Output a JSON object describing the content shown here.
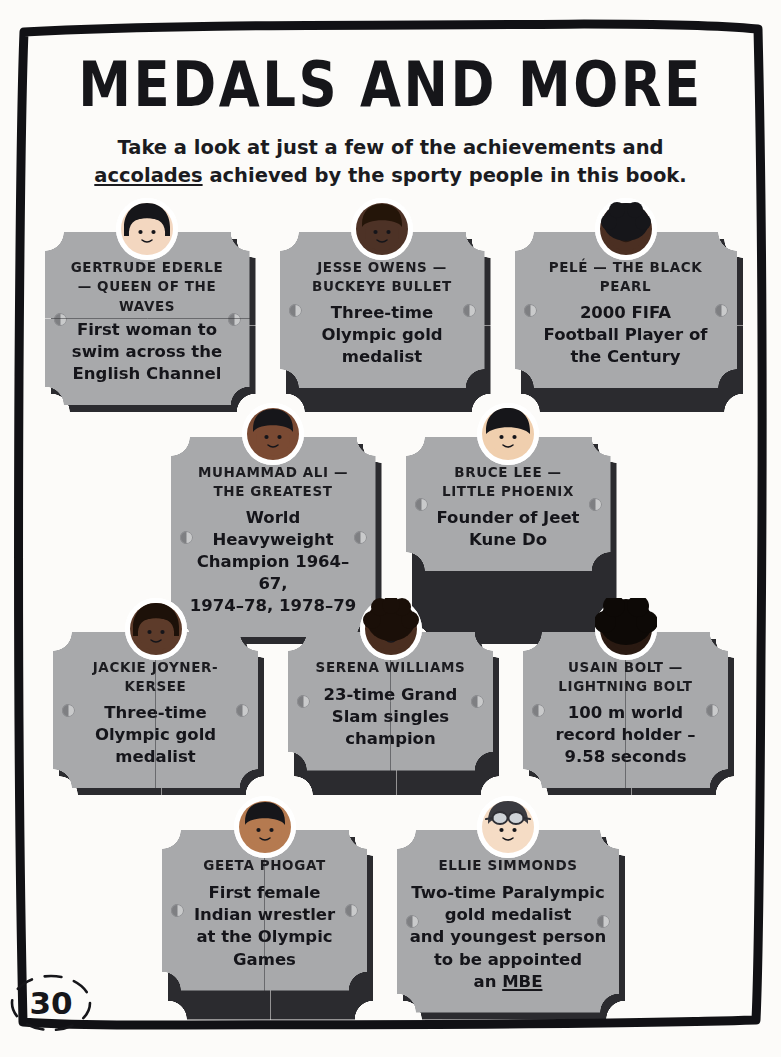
{
  "page": {
    "title_line": "MEDALS AND MORE",
    "page_number": "30"
  },
  "intro": {
    "line1": "Take a look at just a few of the achievements and",
    "line2_pre": "",
    "line2_underlined": "accolades",
    "line2_post": " achieved by the sporty people in this book."
  },
  "rows": [
    {
      "cards": [
        {
          "name": "GERTRUDE EDERLE — QUEEN OF THE WAVES",
          "name_lines": [
            "GERTRUDE EDERLE",
            "— QUEEN OF THE",
            "WAVES"
          ],
          "desc_lines": [
            "First woman to",
            "swim across the",
            "English Channel"
          ],
          "avatar": "avatar-gertrude-ederle",
          "skin": "#f3d7c0",
          "hair": "#16161a",
          "hair_style": "bob"
        },
        {
          "name": "JESSE OWENS — BUCKEYE BULLET",
          "name_lines": [
            "JESSE OWENS —",
            "BUCKEYE BULLET"
          ],
          "desc_lines": [
            "Three-time",
            "Olympic gold",
            "medalist"
          ],
          "avatar": "avatar-jesse-owens",
          "skin": "#4d3226",
          "hair": "#241509",
          "hair_style": "short"
        },
        {
          "name": "PELÉ — THE BLACK PEARL",
          "name_lines": [
            "PELÉ — THE BLACK",
            "PEARL"
          ],
          "desc_lines": [
            "2000 FIFA",
            "Football Player of",
            "the Century"
          ],
          "avatar": "avatar-pele",
          "skin": "#4b2f22",
          "hair": "#16161a",
          "hair_style": "afro-small"
        }
      ]
    },
    {
      "cards": [
        {
          "name": "MUHAMMAD ALI — THE GREATEST",
          "name_lines": [
            "MUHAMMAD ALI —",
            "THE GREATEST"
          ],
          "desc_lines": [
            "World",
            "Heavyweight",
            "Champion 1964–67,",
            "1974–78, 1978–79"
          ],
          "avatar": "avatar-muhammad-ali",
          "skin": "#7a4a33",
          "hair": "#16161a",
          "hair_style": "short"
        },
        {
          "name": "BRUCE LEE — LITTLE PHOENIX",
          "name_lines": [
            "BRUCE LEE —",
            "LITTLE PHOENIX"
          ],
          "desc_lines": [
            "Founder of Jeet",
            "Kune Do"
          ],
          "avatar": "avatar-bruce-lee",
          "skin": "#f0cfae",
          "hair": "#16161a",
          "hair_style": "bowl"
        }
      ]
    },
    {
      "cards": [
        {
          "name": "JACKIE JOYNER-KERSEE",
          "name_lines": [
            "JACKIE JOYNER-",
            "KERSEE"
          ],
          "desc_lines": [
            "Three-time",
            "Olympic gold",
            "medalist"
          ],
          "avatar": "avatar-jackie-joyner-kersee",
          "skin": "#5d3b2a",
          "hair": "#1d1109",
          "hair_style": "bob"
        },
        {
          "name": "SERENA WILLIAMS",
          "name_lines": [
            "SERENA WILLIAMS"
          ],
          "desc_lines": [
            "23-time Grand",
            "Slam singles",
            "champion"
          ],
          "avatar": "avatar-serena-williams",
          "skin": "#4a2e20",
          "hair": "#1a0f08",
          "hair_style": "afro-curly"
        },
        {
          "name": "USAIN BOLT — LIGHTNING BOLT",
          "name_lines": [
            "USAIN BOLT —",
            "LIGHTNING BOLT"
          ],
          "desc_lines": [
            "100 m world",
            "record holder –",
            "9.58 seconds"
          ],
          "avatar": "avatar-usain-bolt",
          "skin": "#2a1a12",
          "hair": "#0d0906",
          "hair_style": "afro-big"
        }
      ]
    },
    {
      "cards": [
        {
          "name": "GEETA PHOGAT",
          "name_lines": [
            "GEETA PHOGAT"
          ],
          "desc_lines": [
            "First female",
            "Indian wrestler",
            "at the Olympic",
            "Games"
          ],
          "avatar": "avatar-geeta-phogat",
          "skin": "#b57a50",
          "hair": "#16161a",
          "hair_style": "short"
        },
        {
          "name": "ELLIE SIMMONDS",
          "name_lines": [
            "ELLIE SIMMONDS"
          ],
          "desc_lines": [
            "Two-time Paralympic",
            "gold medalist",
            "and youngest person",
            "to be appointed"
          ],
          "desc_last_pre": "an ",
          "desc_last_underlined": "MBE",
          "avatar": "avatar-ellie-simmonds",
          "skin": "#f5dcc5",
          "hair": "#3a3a40",
          "hair_style": "goggles"
        }
      ]
    }
  ],
  "colors": {
    "plaque_face": "#a8a9ab",
    "plaque_shadow": "#2b2b2f",
    "page_bg": "#fcfbf9",
    "ink": "#16161a"
  }
}
